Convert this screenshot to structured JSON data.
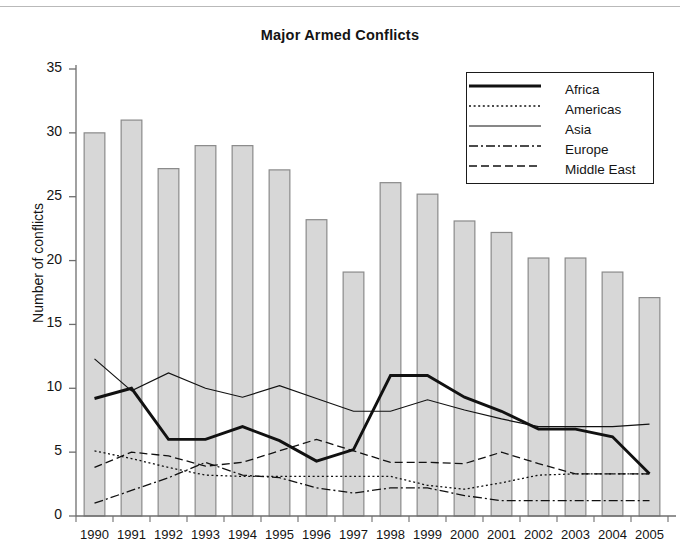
{
  "chart_data": {
    "type": "bar",
    "title": "Major Armed Conflicts",
    "xlabel": "",
    "ylabel": "Number of conflicts",
    "ylim": [
      0,
      35
    ],
    "yticks": [
      0,
      5,
      10,
      15,
      20,
      25,
      30,
      35
    ],
    "grid": false,
    "legend_position": "top-right",
    "categories": [
      "1990",
      "1991",
      "1992",
      "1993",
      "1994",
      "1995",
      "1996",
      "1997",
      "1998",
      "1999",
      "2000",
      "2001",
      "2002",
      "2003",
      "2004",
      "2005"
    ],
    "bars": {
      "name": "Total major armed conflicts",
      "values": [
        30,
        31,
        27.2,
        29,
        29,
        27.1,
        23.2,
        19.1,
        26.1,
        25.2,
        23.1,
        22.2,
        20.2,
        20.2,
        19.1,
        17.1
      ],
      "fill": "#d7d7d7",
      "stroke": "#8a8a8a"
    },
    "series": [
      {
        "name": "Africa",
        "style": "solid-thick",
        "color": "#111111",
        "values": [
          9.2,
          10.0,
          6.0,
          6.0,
          7.0,
          5.9,
          4.3,
          5.2,
          11.0,
          11.0,
          9.3,
          8.2,
          6.8,
          6.8,
          6.2,
          3.3
        ]
      },
      {
        "name": "Americas",
        "style": "dotted",
        "color": "#111111",
        "values": [
          5.1,
          4.5,
          3.8,
          3.2,
          3.1,
          3.1,
          3.1,
          3.1,
          3.1,
          2.4,
          2.1,
          2.6,
          3.2,
          3.3,
          3.3,
          3.3
        ]
      },
      {
        "name": "Asia",
        "style": "solid-thin",
        "color": "#111111",
        "values": [
          12.3,
          9.8,
          11.2,
          10.0,
          9.3,
          10.2,
          9.2,
          8.2,
          8.2,
          9.1,
          8.3,
          7.6,
          7.0,
          7.0,
          7.0,
          7.2
        ]
      },
      {
        "name": "Europe",
        "style": "dash-dot",
        "color": "#111111",
        "values": [
          1.0,
          2.0,
          3.0,
          4.2,
          3.2,
          3.0,
          2.2,
          1.8,
          2.2,
          2.2,
          1.6,
          1.2,
          1.2,
          1.2,
          1.2,
          1.2
        ]
      },
      {
        "name": "Middle East",
        "style": "dashed",
        "color": "#111111",
        "values": [
          3.8,
          5.0,
          4.7,
          3.9,
          4.2,
          5.1,
          6.0,
          5.1,
          4.2,
          4.2,
          4.1,
          5.0,
          4.1,
          3.3,
          3.3,
          3.3
        ]
      }
    ]
  },
  "legend": {
    "items": [
      {
        "label": "Africa",
        "style": "solid-thick"
      },
      {
        "label": "Americas",
        "style": "dotted"
      },
      {
        "label": "Asia",
        "style": "solid-thin"
      },
      {
        "label": "Europe",
        "style": "dash-dot"
      },
      {
        "label": "Middle East",
        "style": "dashed"
      }
    ]
  }
}
